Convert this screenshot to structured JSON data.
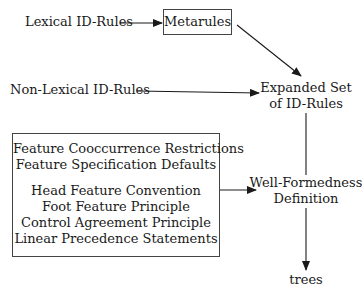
{
  "diagram": {
    "nodes": {
      "lexical_id_rules": "Lexical ID-Rules",
      "metarules": "Metarules",
      "non_lexical_id_rules": "Non-Lexical ID-Rules",
      "expanded_set": [
        "Expanded Set",
        "of ID-Rules"
      ],
      "constraints": {
        "group1": [
          "Feature Cooccurrence Restrictions",
          "Feature Specification Defaults"
        ],
        "group2": [
          "Head Feature Convention",
          "Foot Feature Principle",
          "Control Agreement Principle",
          "Linear Precedence Statements"
        ]
      },
      "well_formedness": [
        "Well-Formedness",
        "Definition"
      ],
      "trees": "trees"
    },
    "edges": [
      {
        "from": "Lexical ID-Rules",
        "to": "Metarules"
      },
      {
        "from": "Metarules",
        "to": "Expanded Set of ID-Rules"
      },
      {
        "from": "Non-Lexical ID-Rules",
        "to": "Expanded Set of ID-Rules"
      },
      {
        "from": "Expanded Set of ID-Rules",
        "to": "Well-Formedness Definition"
      },
      {
        "from": "Constraints box",
        "to": "Well-Formedness Definition"
      },
      {
        "from": "Well-Formedness Definition",
        "to": "trees"
      }
    ],
    "colors": {
      "line": "#1a1a1a",
      "box_border": "#444444"
    }
  }
}
